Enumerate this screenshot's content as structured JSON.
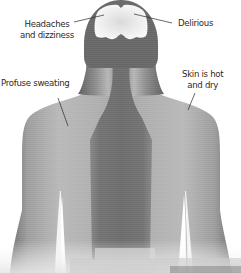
{
  "diagram": {
    "labels": {
      "headaches": {
        "line1": "Headaches",
        "line2": "and dizziness"
      },
      "delirious": {
        "line1": "Delirious"
      },
      "sweating": {
        "line1": "Profuse sweating"
      },
      "skin": {
        "line1": "Skin is hot",
        "line2": "and dry"
      }
    },
    "colors": {
      "background": "#ffffff",
      "body_light": "#b9b9b9",
      "body_mid": "#9a9a9a",
      "body_edge": "#6d6d6d",
      "spine_dark": "#6e6e6e",
      "head_outline": "#606060",
      "brain": "#f2f2f2",
      "text": "#2a2a2a",
      "leader_line": "#222222"
    }
  }
}
